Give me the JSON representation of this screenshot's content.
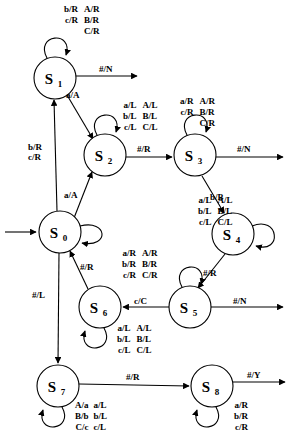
{
  "diagram": {
    "type": "state-machine",
    "title": "",
    "states": [
      {
        "id": "S0",
        "label": "S",
        "subscript": "0",
        "cx": 60,
        "cy": 232,
        "r": 21
      },
      {
        "id": "S1",
        "label": "S",
        "subscript": "1",
        "cx": 55,
        "cy": 78,
        "r": 21
      },
      {
        "id": "S2",
        "label": "S",
        "subscript": "2",
        "cx": 105,
        "cy": 155,
        "r": 21
      },
      {
        "id": "S3",
        "label": "S",
        "subscript": "3",
        "cx": 195,
        "cy": 155,
        "r": 21
      },
      {
        "id": "S4",
        "label": "S",
        "subscript": "4",
        "cx": 233,
        "cy": 234,
        "r": 21
      },
      {
        "id": "S5",
        "label": "S",
        "subscript": "5",
        "cx": 190,
        "cy": 307,
        "r": 21
      },
      {
        "id": "S6",
        "label": "S",
        "subscript": "6",
        "cx": 100,
        "cy": 307,
        "r": 21
      },
      {
        "id": "S7",
        "label": "S",
        "subscript": "7",
        "cx": 58,
        "cy": 386,
        "r": 21
      },
      {
        "id": "S8",
        "label": "S",
        "subscript": "8",
        "cx": 212,
        "cy": 386,
        "r": 21
      }
    ],
    "start_arrow": {
      "from": "S0",
      "label": ""
    },
    "transitions": [
      {
        "from": "S0",
        "to": "S1",
        "label": "b/R\nc/R",
        "label_x": 28,
        "label_y": 148
      },
      {
        "from": "S0",
        "to": "S2",
        "label": "a/A",
        "label_x": 64,
        "label_y": 196
      },
      {
        "from": "S0",
        "to": "S7",
        "label": "#/L",
        "label_x": 32,
        "label_y": 296
      },
      {
        "from": "S1",
        "to": "S2",
        "label": "a/A",
        "label_x": 66,
        "label_y": 96
      },
      {
        "from": "S1",
        "to": "OUT",
        "label": "#/N",
        "label_x": 99,
        "label_y": 71
      },
      {
        "from": "S2",
        "to": "S3",
        "label": "#/R",
        "label_x": 139,
        "label_y": 150
      },
      {
        "from": "S3",
        "to": "OUT",
        "label": "#/N",
        "label_x": 239,
        "label_y": 150
      },
      {
        "from": "S3",
        "to": "S4",
        "label": "b/B",
        "label_x": 212,
        "label_y": 200
      },
      {
        "from": "S4",
        "to": "S5",
        "label": "#/R",
        "label_x": 205,
        "label_y": 276
      },
      {
        "from": "S5",
        "to": "S6",
        "label": "c/C",
        "label_x": 136,
        "label_y": 303
      },
      {
        "from": "S5",
        "to": "OUT",
        "label": "#/N",
        "label_x": 235,
        "label_y": 303
      },
      {
        "from": "S6",
        "to": "S0",
        "label": "#/R",
        "label_x": 82,
        "label_y": 268
      },
      {
        "from": "S7",
        "to": "S8",
        "label": "#/R",
        "label_x": 128,
        "label_y": 380
      },
      {
        "from": "S8",
        "to": "OUT",
        "label": "#/Y",
        "label_x": 249,
        "label_y": 380
      }
    ],
    "self_loops": [
      {
        "state": "S1",
        "label_col1": "b/R\nc/R",
        "label_col2": "A/R\nB/R\nC/R",
        "label_x": 66,
        "label_y": 8,
        "position": "top"
      },
      {
        "state": "S2",
        "label_col1": "a/L\nb/L\nc/L",
        "label_col2": "A/L\nB/L\nC/L",
        "label_x": 125,
        "label_y": 104,
        "position": "top"
      },
      {
        "state": "S3",
        "label_col1": "a/R\nc/R",
        "label_col2": "A/R\nB/R\nC/R",
        "label_x": 182,
        "label_y": 100,
        "position": "top"
      },
      {
        "state": "S4",
        "label_col1": "a/L\nb/L\nc/L",
        "label_col2": "A/L\nB/L\nC/L",
        "label_x": 200,
        "label_y": 199,
        "position": "right"
      },
      {
        "state": "S5",
        "label_col1": "a/R\nb/R\nc/R",
        "label_col2": "A/R\nB/R\nC/R",
        "label_x": 124,
        "label_y": 252,
        "position": "top"
      },
      {
        "state": "S6",
        "label_col1": "a/L\nb/L\nc/L",
        "label_col2": "A/L\nB/L\nC/L",
        "label_x": 119,
        "label_y": 327,
        "position": "bottom"
      },
      {
        "state": "S7",
        "label_col1": "A/a\nB/b\nC/c",
        "label_col2": "a/L\nb/L\nc/L",
        "label_x": 77,
        "label_y": 404,
        "position": "bottom"
      },
      {
        "state": "S8",
        "label_col1": "a/R\nb/R\nc/R",
        "label_col2": "",
        "label_x": 236,
        "label_y": 404,
        "position": "bottom"
      }
    ]
  }
}
